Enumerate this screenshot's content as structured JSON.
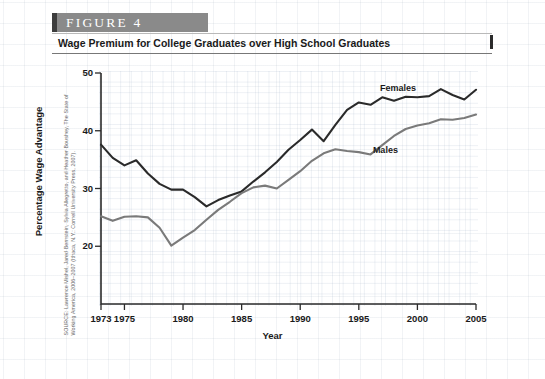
{
  "figure": {
    "banner_label": "FIGURE  4",
    "title": "Wage Premium for College Graduates over High School Graduates",
    "source_note_lines": [
      "SOURCE: Lawrence Mishel, Jared Bernstein, Sylvia Allegretto, and Heather Boushey, The State of",
      "Working America, 2006–2007 (Ithaca, N.Y.: Cornell University Press, 2007)."
    ]
  },
  "colors": {
    "banner_background": "#8a8a8a",
    "banner_accent": "#3d3d3d",
    "females_line": "#2a2a2a",
    "males_line": "#7a7a7a",
    "axis": "#2b2b2b",
    "grid": "#c3cfdf"
  },
  "chart_data": {
    "type": "line",
    "title": "Wage Premium for College Graduates over High School Graduates",
    "xlabel": "Year",
    "ylabel": "Percentage Wage Advantage",
    "xlim": [
      1973,
      2005
    ],
    "ylim": [
      10,
      50
    ],
    "ytick_labels": [
      "20",
      "30",
      "40",
      "50"
    ],
    "yticks": [
      20,
      30,
      40,
      50
    ],
    "xtick_labels": [
      "1973",
      "1975",
      "1980",
      "1985",
      "1990",
      "1995",
      "2000",
      "2005"
    ],
    "xticks": [
      1973,
      1975,
      1980,
      1985,
      1990,
      1995,
      2000,
      2005
    ],
    "grid": true,
    "legend": "inline-labels",
    "x": [
      1973,
      1974,
      1975,
      1976,
      1977,
      1978,
      1979,
      1980,
      1981,
      1982,
      1983,
      1984,
      1985,
      1986,
      1987,
      1988,
      1989,
      1990,
      1991,
      1992,
      1993,
      1994,
      1995,
      1996,
      1997,
      1998,
      1999,
      2000,
      2001,
      2002,
      2003,
      2004,
      2005
    ],
    "series": [
      {
        "name": "Females",
        "color": "#2a2a2a",
        "values": [
          37.6,
          35.3,
          34.0,
          34.9,
          32.6,
          30.8,
          29.8,
          29.8,
          28.5,
          26.9,
          28.0,
          28.8,
          29.5,
          31.2,
          32.8,
          34.6,
          36.7,
          38.4,
          40.2,
          38.2,
          41.0,
          43.6,
          44.9,
          44.5,
          45.8,
          45.2,
          45.9,
          45.8,
          46.0,
          47.2,
          46.2,
          45.4,
          47.1
        ]
      },
      {
        "name": "Males",
        "color": "#7a7a7a",
        "values": [
          25.2,
          24.4,
          25.1,
          25.2,
          25.0,
          23.2,
          20.1,
          21.5,
          22.8,
          24.6,
          26.3,
          27.7,
          29.2,
          30.2,
          30.5,
          30.0,
          31.5,
          33.0,
          34.8,
          36.1,
          36.8,
          36.5,
          36.3,
          35.9,
          37.5,
          39.1,
          40.3,
          40.9,
          41.3,
          42.0,
          41.9,
          42.2,
          42.8
        ]
      }
    ],
    "annotations": [
      {
        "text": "Females",
        "x": 1996.8,
        "y": 48.3
      },
      {
        "text": "Males",
        "x": 1996.2,
        "y": 37.6
      }
    ]
  }
}
